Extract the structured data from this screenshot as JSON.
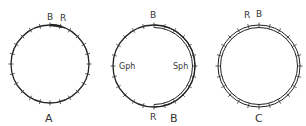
{
  "diagrams": [
    {
      "id": "A",
      "caption": "A",
      "markers": [
        {
          "text": "B"
        },
        {
          "text": "R"
        }
      ]
    },
    {
      "id": "B",
      "caption": "B",
      "markers": [
        {
          "text": "B"
        },
        {
          "text": "Gph"
        },
        {
          "text": "Sph"
        },
        {
          "text": "R"
        }
      ]
    },
    {
      "id": "C",
      "caption": "C",
      "markers": [
        {
          "text": "R"
        },
        {
          "text": "B"
        }
      ]
    }
  ]
}
